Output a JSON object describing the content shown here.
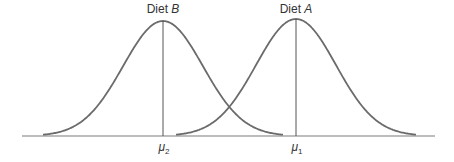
{
  "chart_data": {
    "type": "line",
    "title": "",
    "xlabel": "",
    "ylabel": "",
    "grid": false,
    "legend": "none",
    "series": [
      {
        "name": "Diet B",
        "label_prefix": "Diet ",
        "label_var": "B",
        "mean_label": "μ",
        "mean_sub": "2",
        "mean_px": 163,
        "sigma_px": 40,
        "peak_y_px": 21
      },
      {
        "name": "Diet A",
        "label_prefix": "Diet ",
        "label_var": "A",
        "mean_label": "μ",
        "mean_sub": "1",
        "mean_px": 296,
        "sigma_px": 40,
        "peak_y_px": 19
      }
    ],
    "x_tick_labels": [
      "μ2",
      "μ1"
    ],
    "axis": {
      "baseline_y_px": 136,
      "x_start_px": 22,
      "x_end_px": 435
    }
  },
  "colors": {
    "curve": "#6b6b6b",
    "axis": "#7a7a7a",
    "text": "#333333"
  }
}
